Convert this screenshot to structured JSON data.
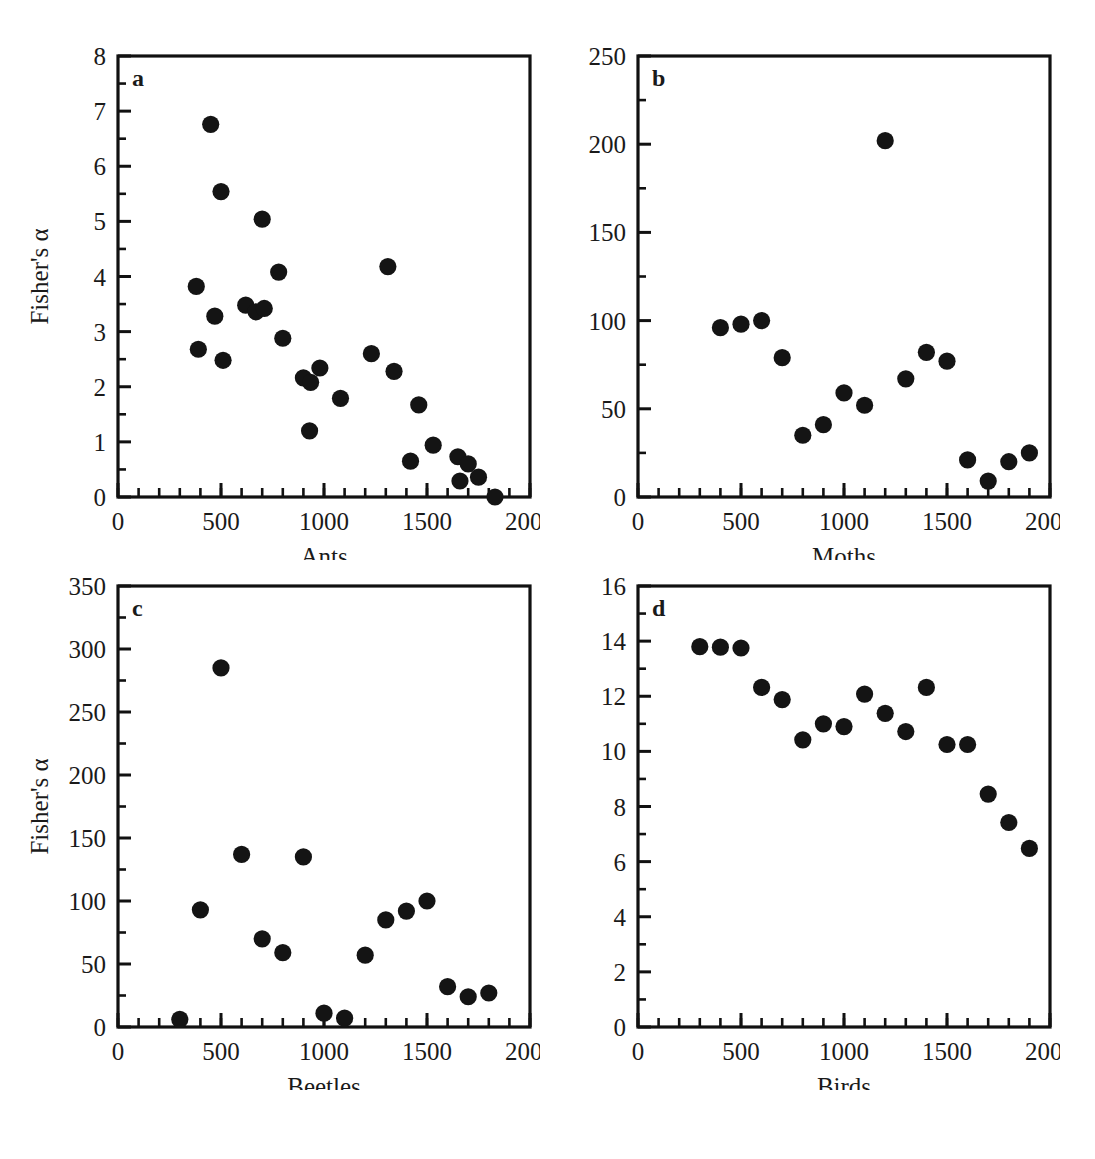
{
  "figure": {
    "shared_ylabel": "Fisher's α",
    "shared_xlabel": "Elevation (m)",
    "background_color": "#ffffff",
    "marker_color": "#141414",
    "axis_color": "#111111"
  },
  "chart_data": [
    {
      "type": "scatter",
      "panel": "a",
      "title": "",
      "xlabel": "Ants",
      "ylabel": "Fisher's α",
      "xlim": [
        0,
        2000
      ],
      "ylim": [
        0,
        8
      ],
      "xticks": [
        0,
        500,
        1000,
        1500,
        2000
      ],
      "yticks": [
        0,
        1,
        2,
        3,
        4,
        5,
        6,
        7,
        8
      ],
      "xtick_labels": [
        "0",
        "500",
        "1000",
        "1500",
        "2000"
      ],
      "ytick_labels": [
        "0",
        "1",
        "2",
        "3",
        "4",
        "5",
        "6",
        "7",
        "8"
      ],
      "x_minor_step": 100,
      "grid": false,
      "legend": "none",
      "x": [
        380,
        390,
        450,
        470,
        500,
        510,
        620,
        670,
        700,
        710,
        780,
        800,
        900,
        930,
        935,
        980,
        1080,
        1230,
        1310,
        1340,
        1420,
        1460,
        1530,
        1650,
        1660,
        1700,
        1750,
        1830
      ],
      "y": [
        3.82,
        2.68,
        6.76,
        3.28,
        5.54,
        2.48,
        3.48,
        3.36,
        5.04,
        3.42,
        4.08,
        2.88,
        2.16,
        1.2,
        2.08,
        2.34,
        1.79,
        2.6,
        4.18,
        2.28,
        0.65,
        1.67,
        0.94,
        0.73,
        0.29,
        0.6,
        0.36,
        0.0
      ]
    },
    {
      "type": "scatter",
      "panel": "b",
      "title": "",
      "xlabel": "Moths",
      "ylabel": "Fisher's α",
      "xlim": [
        0,
        2000
      ],
      "ylim": [
        0,
        250
      ],
      "xticks": [
        0,
        500,
        1000,
        1500,
        2000
      ],
      "yticks": [
        0,
        50,
        100,
        150,
        200,
        250
      ],
      "xtick_labels": [
        "0",
        "500",
        "1000",
        "1500",
        "2000"
      ],
      "ytick_labels": [
        "0",
        "50",
        "100",
        "150",
        "200",
        "250"
      ],
      "x_minor_step": 100,
      "grid": false,
      "legend": "none",
      "x": [
        400,
        500,
        600,
        700,
        800,
        900,
        1000,
        1100,
        1200,
        1300,
        1400,
        1500,
        1600,
        1700,
        1800,
        1900
      ],
      "y": [
        96,
        98,
        100,
        79,
        35,
        41,
        59,
        52,
        202,
        67,
        82,
        77,
        21,
        9,
        20,
        25
      ]
    },
    {
      "type": "scatter",
      "panel": "c",
      "title": "",
      "xlabel": "Beetles",
      "ylabel": "Fisher's α",
      "xlim": [
        0,
        2000
      ],
      "ylim": [
        0,
        350
      ],
      "xticks": [
        0,
        500,
        1000,
        1500,
        2000
      ],
      "yticks": [
        0,
        50,
        100,
        150,
        200,
        250,
        300,
        350
      ],
      "xtick_labels": [
        "0",
        "500",
        "1000",
        "1500",
        "2000"
      ],
      "ytick_labels": [
        "0",
        "50",
        "100",
        "150",
        "200",
        "250",
        "300",
        "350"
      ],
      "x_minor_step": 100,
      "grid": false,
      "legend": "none",
      "x": [
        300,
        400,
        500,
        600,
        700,
        800,
        900,
        1000,
        1100,
        1200,
        1300,
        1400,
        1500,
        1600,
        1700,
        1800
      ],
      "y": [
        6,
        93,
        285,
        137,
        70,
        59,
        135,
        11,
        7,
        57,
        85,
        92,
        100,
        32,
        24,
        27
      ]
    },
    {
      "type": "scatter",
      "panel": "d",
      "title": "",
      "xlabel": "Birds",
      "ylabel": "Fisher's α",
      "xlim": [
        0,
        2000
      ],
      "ylim": [
        0,
        16
      ],
      "xticks": [
        0,
        500,
        1000,
        1500,
        2000
      ],
      "yticks": [
        0,
        2,
        4,
        6,
        8,
        10,
        12,
        14,
        16
      ],
      "xtick_labels": [
        "0",
        "500",
        "1000",
        "1500",
        "2000"
      ],
      "ytick_labels": [
        "0",
        "2",
        "4",
        "6",
        "8",
        "10",
        "12",
        "14",
        "16"
      ],
      "x_minor_step": 100,
      "grid": false,
      "legend": "none",
      "x": [
        300,
        400,
        500,
        600,
        700,
        800,
        900,
        1000,
        1100,
        1200,
        1300,
        1400,
        1500,
        1600,
        1700,
        1800,
        1900
      ],
      "y": [
        13.8,
        13.78,
        13.75,
        12.32,
        11.88,
        10.42,
        11.0,
        10.9,
        12.08,
        11.38,
        10.72,
        12.32,
        10.25,
        10.25,
        8.45,
        7.42,
        6.48
      ]
    }
  ]
}
